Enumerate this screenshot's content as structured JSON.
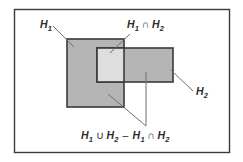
{
  "figure": {
    "type": "set-diagram",
    "background_color": "#ffffff",
    "border_color": "#3a3a3a",
    "frame": {
      "x": 14,
      "y": 9,
      "width": 215,
      "height": 143
    }
  },
  "shapes": {
    "set_h1": {
      "name": "H1 rectangle",
      "x": 67,
      "y": 39,
      "width": 57,
      "height": 68,
      "fill": "#b5b5b5",
      "stroke": "#3a3a3a"
    },
    "set_h2": {
      "name": "H2 rectangle",
      "x": 97,
      "y": 48,
      "width": 76,
      "height": 34,
      "fill": "#b5b5b5",
      "stroke": "#3a3a3a"
    },
    "intersection": {
      "name": "H1 intersect H2 region",
      "x": 97,
      "y": 48,
      "width": 27,
      "height": 34,
      "fill": "#dedede",
      "stroke": "#3a3a3a"
    }
  },
  "labels": {
    "h1": {
      "base": "H",
      "sub": "1"
    },
    "h2": {
      "base": "H",
      "sub": "2"
    },
    "intersection": {
      "full": "H1 ∩ H2",
      "part1_base": "H",
      "part1_sub": "1",
      "operator": "∩",
      "part2_base": "H",
      "part2_sub": "2"
    },
    "symmetric_difference": {
      "full": "H1 ∪ H2 − H1 ∩ H2",
      "t1_base": "H",
      "t1_sub": "1",
      "op1": "∪",
      "t2_base": "H",
      "t2_sub": "2",
      "op2": "–",
      "t3_base": "H",
      "t3_sub": "1",
      "op3": "∩",
      "t4_base": "H",
      "t4_sub": "2"
    }
  },
  "leader_lines": {
    "h1_line": {
      "x1": 53,
      "y1": 26,
      "x2": 74,
      "y2": 47
    },
    "intersection_line": {
      "x1": 130,
      "y1": 34,
      "x2": 110,
      "y2": 53
    },
    "h2_line": {
      "x1": 193,
      "y1": 91,
      "x2": 171,
      "y2": 70
    },
    "diff_line_diagonal": {
      "x1": 108,
      "y1": 94,
      "x2": 146,
      "y2": 126
    },
    "diff_line_vertical": {
      "x1": 146,
      "y1": 72,
      "x2": 146,
      "y2": 126
    }
  },
  "colors": {
    "fill_medium": "#b5b5b5",
    "fill_light": "#dedede",
    "stroke": "#3a3a3a",
    "text": "#2b2b2b",
    "leader": "#6e6e6e"
  }
}
